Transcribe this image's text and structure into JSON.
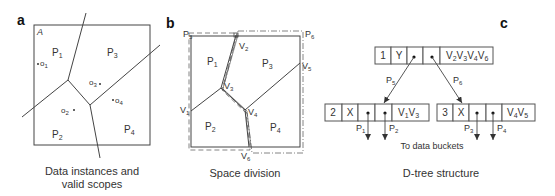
{
  "panels": {
    "a": {
      "letter": "a",
      "region_label": "A",
      "partitions": [
        "P1",
        "P2",
        "P3",
        "P4"
      ],
      "instances": [
        "o1",
        "o2",
        "o3",
        "o4"
      ],
      "caption_line1": "Data instances and",
      "caption_line2": "valid scopes"
    },
    "b": {
      "letter": "b",
      "partitions": [
        "P1",
        "P2",
        "P3",
        "P4"
      ],
      "outer_partitions": [
        "P5",
        "P6"
      ],
      "vertices": [
        "V1",
        "V2",
        "V3",
        "V4",
        "V5",
        "V6"
      ],
      "caption": "Space division"
    },
    "c": {
      "letter": "c",
      "root": {
        "id": "1",
        "dim": "Y",
        "vertices": "V2V3V4V6"
      },
      "left_child": {
        "id": "2",
        "dim": "X",
        "vertices": "V1V3"
      },
      "right_child": {
        "id": "3",
        "dim": "X",
        "vertices": "V4V5"
      },
      "edge_labels": {
        "left": "P5",
        "right": "P6"
      },
      "leaf_labels": [
        "P1",
        "P2",
        "P3",
        "P4"
      ],
      "buckets_label": "To data buckets",
      "caption": "D-tree structure"
    }
  }
}
